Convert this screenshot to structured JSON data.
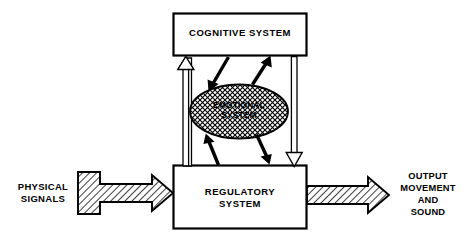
{
  "diagram": {
    "background_color": "#ffffff",
    "stroke_color": "#000000",
    "nodes": {
      "cognitive": {
        "label": "COGNITIVE SYSTEM",
        "shape": "rectangle",
        "fill": "#ffffff",
        "stroke": "#000000"
      },
      "emotional": {
        "label": "EMOTIONAL\nSYSTEM",
        "shape": "ellipse",
        "fill": "crosshatch-pattern",
        "stroke": "#000000"
      },
      "regulatory": {
        "label": "REGULATORY\nSYSTEM",
        "shape": "rectangle",
        "fill": "#ffffff",
        "stroke": "#000000"
      }
    },
    "external": {
      "input": {
        "label": "PHYSICAL\nSIGNALS",
        "arrow_style": "hatched-block-arrow",
        "direction": "right"
      },
      "output": {
        "label": "OUTPUT\nMOVEMENT\nAND\nSOUND",
        "arrow_style": "hatched-block-arrow",
        "direction": "right"
      }
    },
    "connectors": [
      {
        "name": "regulatory-to-cognitive",
        "style": "hollow-outline-arrow",
        "from": "regulatory",
        "to": "cognitive",
        "direction": "up"
      },
      {
        "name": "cognitive-to-regulatory",
        "style": "hollow-outline-arrow",
        "from": "cognitive",
        "to": "regulatory",
        "direction": "down"
      },
      {
        "name": "cognitive-to-emotional",
        "style": "solid-black-arrow",
        "from": "cognitive",
        "to": "emotional",
        "direction": "down-left"
      },
      {
        "name": "emotional-to-cognitive",
        "style": "solid-black-arrow",
        "from": "emotional",
        "to": "cognitive",
        "direction": "up-right"
      },
      {
        "name": "regulatory-to-emotional",
        "style": "solid-black-arrow",
        "from": "regulatory",
        "to": "emotional",
        "direction": "up-left"
      },
      {
        "name": "emotional-to-regulatory",
        "style": "solid-black-arrow",
        "from": "emotional",
        "to": "regulatory",
        "direction": "down-right"
      }
    ]
  }
}
